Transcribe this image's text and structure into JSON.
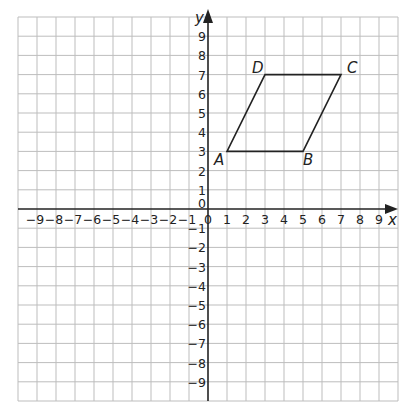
{
  "diagram": {
    "type": "coordinate-grid",
    "x_axis": {
      "label": "x",
      "min": -9,
      "max": 9,
      "ticks": [
        -9,
        -8,
        -7,
        -6,
        -5,
        -4,
        -3,
        -2,
        -1,
        0,
        1,
        2,
        3,
        4,
        5,
        6,
        7,
        8,
        9
      ]
    },
    "y_axis": {
      "label": "y",
      "min": -9,
      "max": 9,
      "ticks": [
        -9,
        -8,
        -7,
        -6,
        -5,
        -4,
        -3,
        -2,
        -1,
        0,
        1,
        2,
        3,
        4,
        5,
        6,
        7,
        8,
        9
      ]
    },
    "origin_label": "0",
    "grid_range": {
      "xmin": -10,
      "xmax": 10,
      "ymin": -10,
      "ymax": 10
    },
    "shape": {
      "name": "parallelogram ABCD",
      "vertices": [
        {
          "label": "A",
          "x": 1,
          "y": 3
        },
        {
          "label": "B",
          "x": 5,
          "y": 3
        },
        {
          "label": "C",
          "x": 7,
          "y": 7
        },
        {
          "label": "D",
          "x": 3,
          "y": 7
        }
      ]
    },
    "colors": {
      "grid": "#bdbdbd",
      "axes": "#222222",
      "shape": "#222222",
      "background": "#ffffff"
    }
  }
}
